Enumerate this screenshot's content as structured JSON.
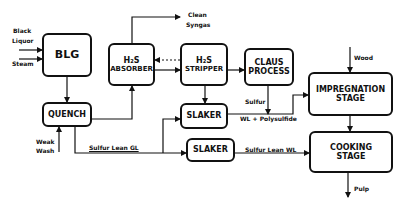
{
  "diagram": {
    "type": "process-flow",
    "nodes": {
      "blg": {
        "label": "BLG"
      },
      "quench": {
        "label": "QUENCH"
      },
      "absorber": {
        "line1": "H₂S",
        "line2": "ABSORBER"
      },
      "stripper": {
        "line1": "H₂S",
        "line2": "STRIPPER"
      },
      "claus": {
        "line1": "CLAUS",
        "line2": "PROCESS"
      },
      "impregnation": {
        "line1": "IMPREGNATION",
        "line2": "STAGE"
      },
      "cooking": {
        "line1": "COOKING",
        "line2": "STAGE"
      },
      "slaker1": {
        "label": "SLAKER"
      },
      "slaker2": {
        "label": "SLAKER"
      }
    },
    "labels": {
      "black_liquor_1": "Black",
      "black_liquor_2": "Liquor",
      "steam": "Steam",
      "clean_syngas_1": "Clean",
      "clean_syngas_2": "Syngas",
      "weak_wash_1": "Weak",
      "weak_wash_2": "Wash",
      "sulfur_lean_gl": "Sulfur Lean GL",
      "sulfur": "Sulfur",
      "wl_polysulfide": "WL + Polysulfide",
      "sulfur_lean_wl": "Sulfur Lean WL",
      "wood": "Wood",
      "pulp": "Pulp"
    },
    "edges": [
      {
        "from": "Black Liquor",
        "to": "BLG"
      },
      {
        "from": "Steam",
        "to": "BLG"
      },
      {
        "from": "BLG",
        "to": "QUENCH"
      },
      {
        "from": "QUENCH",
        "to": "H2S ABSORBER"
      },
      {
        "from": "H2S ABSORBER",
        "to": "Clean Syngas"
      },
      {
        "from": "H2S ABSORBER",
        "to": "H2S STRIPPER"
      },
      {
        "from": "H2S STRIPPER",
        "to": "H2S ABSORBER",
        "style": "dashed"
      },
      {
        "from": "H2S STRIPPER",
        "to": "CLAUS PROCESS"
      },
      {
        "from": "H2S STRIPPER",
        "to": "SLAKER"
      },
      {
        "from": "Weak Wash",
        "to": "QUENCH"
      },
      {
        "from": "QUENCH",
        "to": "SLAKER",
        "label": "Sulfur Lean GL"
      },
      {
        "from": "QUENCH",
        "to": "SLAKER (lower)",
        "label": "Sulfur Lean GL"
      },
      {
        "from": "CLAUS PROCESS",
        "to": "WL line",
        "label": "Sulfur"
      },
      {
        "from": "SLAKER",
        "to": "IMPREGNATION STAGE",
        "label": "WL + Polysulfide"
      },
      {
        "from": "SLAKER (lower)",
        "to": "COOKING STAGE",
        "label": "Sulfur Lean WL"
      },
      {
        "from": "Wood",
        "to": "IMPREGNATION STAGE"
      },
      {
        "from": "IMPREGNATION STAGE",
        "to": "COOKING STAGE"
      },
      {
        "from": "COOKING STAGE",
        "to": "Pulp"
      }
    ]
  }
}
